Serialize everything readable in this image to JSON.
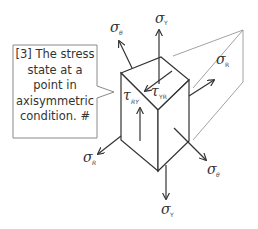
{
  "callout": {
    "text": "[3] The stress state at a point in axisymmetric condition. #"
  },
  "labels": {
    "sigma_theta_top": {
      "symbol": "σ",
      "sub": "θ"
    },
    "sigma_y_top": {
      "symbol": "σ",
      "sub": "Y"
    },
    "sigma_r_right": {
      "symbol": "σ",
      "sub": "R"
    },
    "tau_ry": {
      "symbol": "τ",
      "sub": "RY"
    },
    "tau_yr": {
      "symbol": "τ",
      "sub": "YR"
    },
    "sigma_r_left": {
      "symbol": "σ",
      "sub": "R"
    },
    "sigma_theta_bottom": {
      "symbol": "σ",
      "sub": "θ"
    },
    "sigma_y_bottom": {
      "symbol": "σ",
      "sub": "Y"
    }
  },
  "colors": {
    "line": "#333333",
    "light_line": "#888888",
    "callout_border": "#8a8a8a",
    "text": "#333333"
  }
}
